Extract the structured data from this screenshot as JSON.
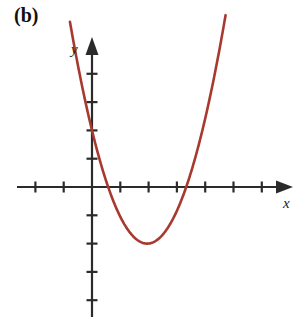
{
  "figure": {
    "panel_label": "(b)",
    "background_color": "#ffffff",
    "width": 308,
    "height": 319
  },
  "axes": {
    "x_axis_label": "x",
    "y_axis_label": "y",
    "axis_color": "#2b2b2b",
    "origin_px": {
      "x": 92,
      "y": 187
    },
    "unit_px": 28.3,
    "x_tick_values": [
      -2,
      -1,
      1,
      2,
      3,
      4,
      5,
      6
    ],
    "y_tick_values": [
      -4,
      -3,
      -2,
      -1,
      1,
      2,
      3,
      4
    ],
    "x_axis_range_px": [
      17,
      292
    ],
    "y_axis_range_px": [
      36,
      317
    ],
    "arrow_heads": [
      "x-positive",
      "y-positive"
    ],
    "tick_length_px": 11,
    "grid": "off"
  },
  "chart_data": {
    "type": "line",
    "title": "",
    "xlabel": "x",
    "ylabel": "y",
    "grid": false,
    "legend": "none",
    "xlim": [
      -2.65,
      7.05
    ],
    "ylim": [
      -4.6,
      5.3
    ],
    "curve_color": "#a8392f",
    "curve_width_px": 2.6,
    "series": [
      {
        "name": "parabola",
        "equation": "y = 1.1(x - 1.95)^2 - 2",
        "vertex": [
          1.95,
          -2.0
        ],
        "y_intercept": 2.0,
        "roots": [
          0.6,
          3.3
        ],
        "x": [
          -0.75,
          -0.5,
          -0.25,
          0,
          0.25,
          0.5,
          0.75,
          1,
          1.25,
          1.5,
          1.75,
          1.95,
          2.25,
          2.5,
          2.75,
          3,
          3.25,
          3.5,
          3.75,
          4,
          4.25,
          4.5,
          4.75
        ],
        "values": [
          6.64,
          5.12,
          3.74,
          2.18,
          1.3,
          0.25,
          -0.66,
          -1.12,
          -1.54,
          -1.82,
          -1.96,
          -2.0,
          -1.9,
          -1.67,
          -1.31,
          -0.81,
          -0.18,
          0.59,
          1.5,
          2.55,
          3.74,
          5.06,
          6.53
        ]
      }
    ]
  }
}
